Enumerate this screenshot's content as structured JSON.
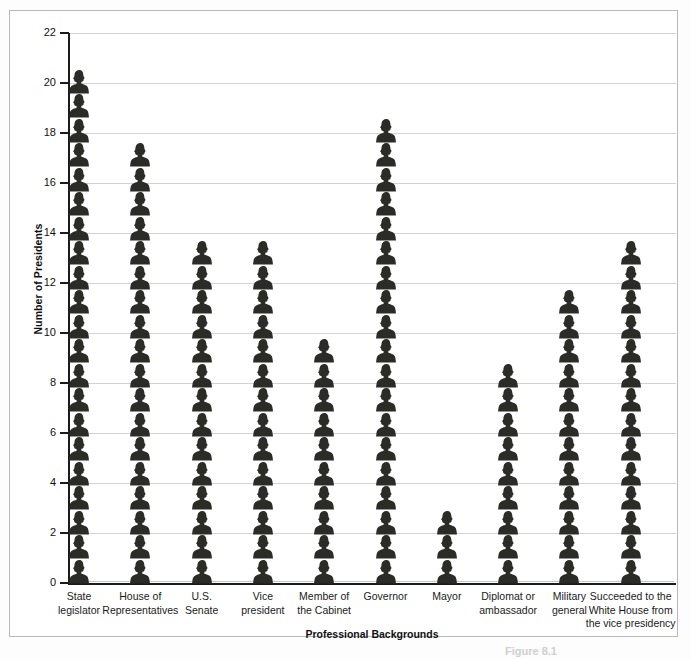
{
  "figure": {
    "frame_border_color": "#b9b9b9",
    "ink_color": "#2b2b28",
    "gridline_color": "#d2d2d2",
    "axis_color": "#1b1b1b",
    "caption_fragment": "Figure 8.1"
  },
  "chart_data": {
    "type": "bar",
    "title": "",
    "xlabel": "Professional Backgrounds",
    "ylabel": "Number of Presidents",
    "ylim": [
      0,
      22
    ],
    "ytick_step": 2,
    "yticks": [
      0,
      2,
      4,
      6,
      8,
      10,
      12,
      14,
      16,
      18,
      20,
      22
    ],
    "ytick_labels": [
      "0",
      "2",
      "4",
      "6",
      "8",
      "10",
      "12",
      "14",
      "16",
      "18",
      "20",
      "22"
    ],
    "grid": "horizontal",
    "legend": "none",
    "glyph": "person-silhouette-icon",
    "glyph_unit_value": 1,
    "categories": [
      "State legislator",
      "House of Representatives",
      "U.S. Senate",
      "Vice president",
      "Member of the Cabinet",
      "Governor",
      "Mayor",
      "Diplomat or ambassador",
      "Military general",
      "Succeeded to the White House from the vice presidency"
    ],
    "category_label_lines": [
      [
        "State",
        "legislator"
      ],
      [
        "House of",
        "Representatives"
      ],
      [
        "U.S.",
        "Senate"
      ],
      [
        "Vice",
        "president"
      ],
      [
        "Member of",
        "the Cabinet"
      ],
      [
        "Governor"
      ],
      [
        "Mayor"
      ],
      [
        "Diplomat or",
        "ambassador"
      ],
      [
        "Military",
        "general"
      ],
      [
        "Succeeded to the",
        "White House from",
        "the vice presidency"
      ]
    ],
    "values": [
      21,
      18,
      14,
      14,
      10,
      19,
      3,
      9,
      12,
      14
    ]
  }
}
